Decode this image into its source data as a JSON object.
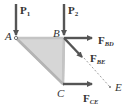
{
  "diagram": {
    "type": "truss-free-body-diagram",
    "colors": {
      "member": "#b9b9b9",
      "fill": "#d6d6d6",
      "arrow": "#555555",
      "text": "#333333",
      "dashed": "#888888"
    },
    "joints": {
      "A": "A",
      "B": "B",
      "C": "C",
      "E": "E"
    },
    "loads": {
      "p1": {
        "base": "P",
        "sub": "1"
      },
      "p2": {
        "base": "P",
        "sub": "2"
      }
    },
    "forces": {
      "f_bd": {
        "base": "F",
        "sub": "BD"
      },
      "f_be": {
        "base": "F",
        "sub": "BE"
      },
      "f_ce": {
        "base": "F",
        "sub": "CE"
      }
    }
  }
}
